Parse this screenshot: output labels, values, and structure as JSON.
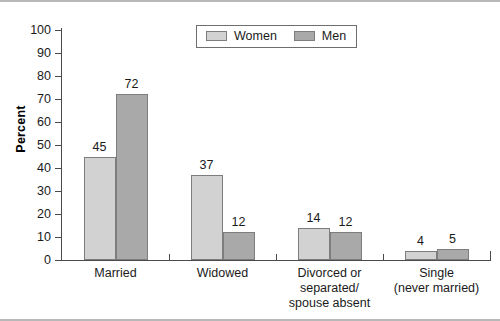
{
  "chart_data": {
    "type": "bar",
    "title": "",
    "subtitle": "",
    "xlabel": "",
    "ylabel": "Percent",
    "ylim": [
      0,
      100
    ],
    "ytick_labels": [
      "100",
      "90",
      "80",
      "70",
      "60",
      "50",
      "40",
      "30",
      "20",
      "10",
      "0"
    ],
    "ytick_values": [
      100,
      90,
      80,
      70,
      60,
      50,
      40,
      30,
      20,
      10,
      0
    ],
    "grid": false,
    "legend_position": "top-center",
    "categories": [
      "Married",
      "Widowed",
      "Divorced or\nseparated/\nspouse absent",
      "Single\n(never married)"
    ],
    "series": [
      {
        "name": "Women",
        "color": "#d2d2d2",
        "values": [
          45,
          37,
          14,
          4
        ],
        "value_labels": [
          "45",
          "37",
          "14",
          "4"
        ]
      },
      {
        "name": "Men",
        "color": "#a9a9a9",
        "values": [
          72,
          12,
          12,
          5
        ],
        "value_labels": [
          "72",
          "12",
          "12",
          "5"
        ]
      }
    ]
  },
  "legend": {
    "entries": [
      {
        "label": "Women",
        "swatch": "women"
      },
      {
        "label": "Men",
        "swatch": "men"
      }
    ]
  }
}
